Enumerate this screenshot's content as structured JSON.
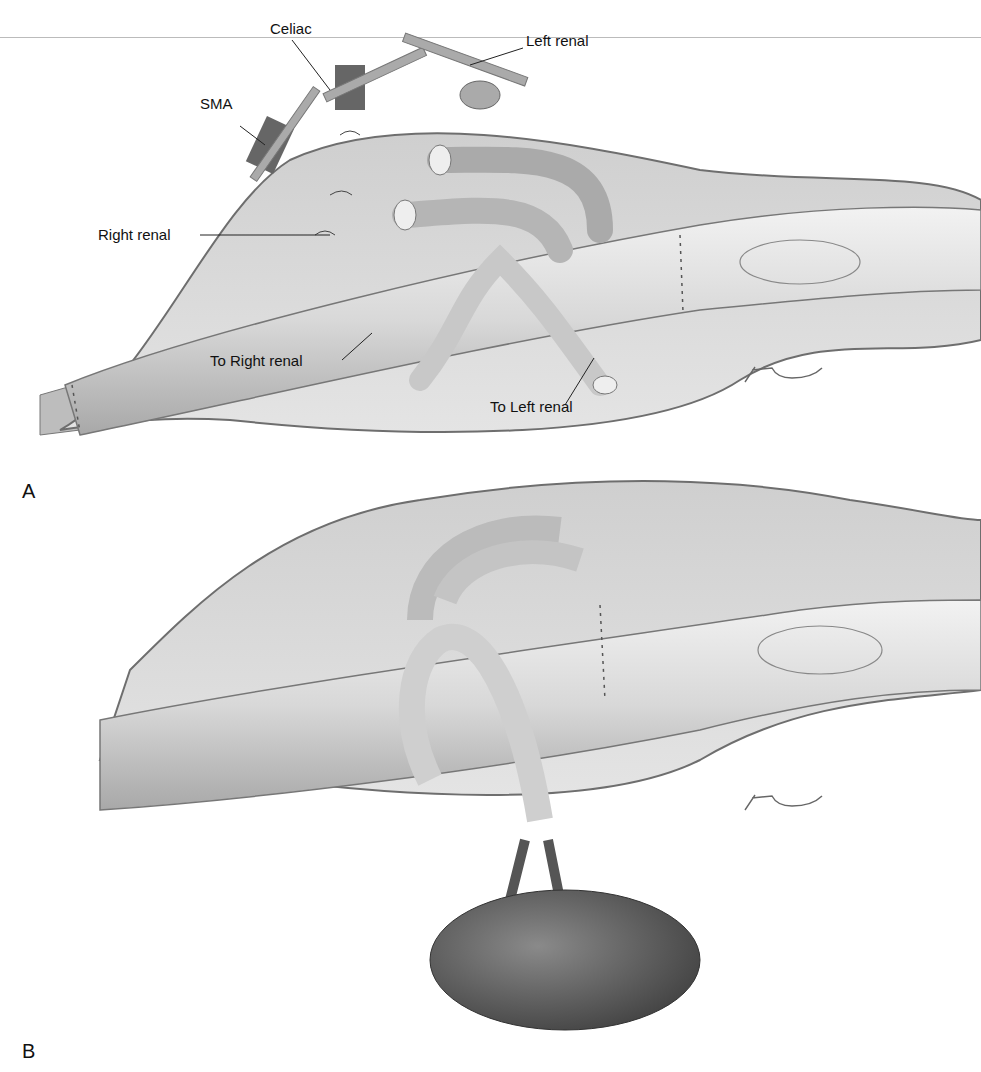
{
  "figure": {
    "panels": [
      {
        "id": "A",
        "label": "A",
        "annotations": {
          "celiac": "Celiac",
          "left_renal": "Left renal",
          "sma": "SMA",
          "right_renal": "Right renal",
          "to_right_renal": "To Right renal",
          "to_left_renal": "To Left renal"
        },
        "signature": "T Phelps"
      },
      {
        "id": "B",
        "label": "B",
        "signature": "T Phelps"
      }
    ]
  },
  "colors": {
    "tissue": "#d9d9d9",
    "graft": "#e6e6e6",
    "outline": "#6e6e6e",
    "kidney": "#555555",
    "text": "#111111"
  }
}
